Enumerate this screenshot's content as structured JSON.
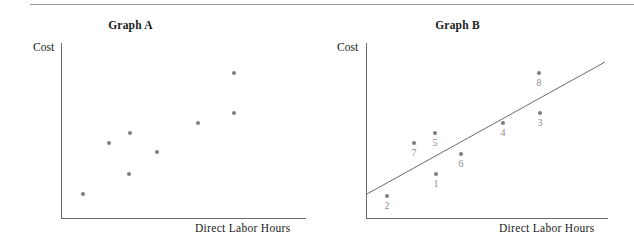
{
  "page": {
    "width": 634,
    "height": 248,
    "background_color": "#ffffff",
    "divider_color": "#9a9a9a",
    "axis_color": "#6b6b6b",
    "dot_color": "#7e7e7e",
    "label_color": "#8a8a8a",
    "text_color": "#1a1a1a"
  },
  "chart_data": [
    {
      "type": "scatter",
      "title": "Graph A",
      "xlabel": "Direct Labor Hours",
      "ylabel": "Cost",
      "grid": false,
      "legend": "none",
      "axis_ticks": [],
      "points": [
        {
          "label": "",
          "px": 83,
          "py": 194
        },
        {
          "label": "",
          "px": 109,
          "py": 143
        },
        {
          "label": "",
          "px": 130,
          "py": 133
        },
        {
          "label": "",
          "px": 129,
          "py": 174
        },
        {
          "label": "",
          "px": 157,
          "py": 152
        },
        {
          "label": "",
          "px": 198,
          "py": 123
        },
        {
          "label": "",
          "px": 234,
          "py": 113
        },
        {
          "label": "",
          "px": 234,
          "py": 73
        }
      ],
      "trendline": null
    },
    {
      "type": "scatter",
      "title": "Graph B",
      "xlabel": "Direct Labor Hours",
      "ylabel": "Cost",
      "grid": false,
      "legend": "none",
      "axis_ticks": [],
      "points": [
        {
          "label": "2",
          "px": 70,
          "py": 196
        },
        {
          "label": "7",
          "px": 97,
          "py": 143
        },
        {
          "label": "1",
          "px": 119,
          "py": 174
        },
        {
          "label": "5",
          "px": 118,
          "py": 133
        },
        {
          "label": "6",
          "px": 144,
          "py": 154
        },
        {
          "label": "4",
          "px": 186,
          "py": 123
        },
        {
          "label": "3",
          "px": 223,
          "py": 113
        },
        {
          "label": "8",
          "px": 222,
          "py": 73
        }
      ],
      "trendline": {
        "x1": 50,
        "y1": 194,
        "x2": 288,
        "y2": 62
      }
    }
  ]
}
